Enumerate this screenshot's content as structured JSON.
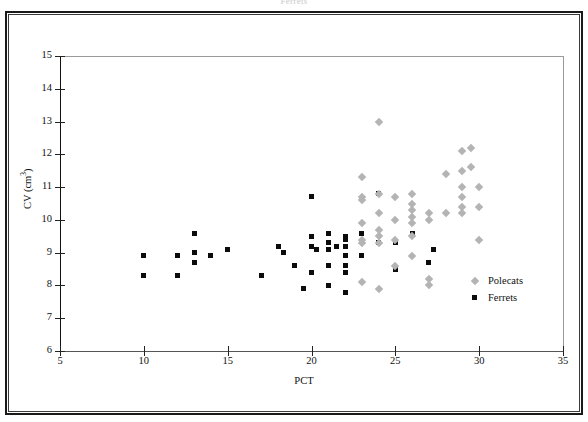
{
  "figure": {
    "top_caption": "Ferrets",
    "background": "#ffffff",
    "frame_color": "#1a1a1a"
  },
  "legend": {
    "position": "inside-right",
    "entries": [
      {
        "label": "Polecats",
        "marker": "diamond",
        "color": "#b4b4b4"
      },
      {
        "label": "Ferrets",
        "marker": "square",
        "color": "#0c0c0c"
      }
    ]
  },
  "chart_data": {
    "type": "scatter",
    "title": "",
    "xlabel": "PCT",
    "ylabel": "CV (cm³)",
    "xlim": [
      5,
      35
    ],
    "ylim": [
      6,
      15
    ],
    "xticks": [
      5,
      10,
      15,
      20,
      25,
      30,
      35
    ],
    "yticks": [
      6,
      7,
      8,
      9,
      10,
      11,
      12,
      13,
      14,
      15
    ],
    "grid": false,
    "series": [
      {
        "name": "Ferrets",
        "marker": "square",
        "color": "#0c0c0c",
        "points": [
          [
            10.0,
            8.9
          ],
          [
            10.0,
            8.3
          ],
          [
            12.0,
            8.9
          ],
          [
            12.0,
            8.3
          ],
          [
            13.0,
            9.6
          ],
          [
            13.0,
            9.0
          ],
          [
            13.0,
            8.7
          ],
          [
            14.0,
            8.9
          ],
          [
            15.0,
            9.1
          ],
          [
            17.0,
            8.3
          ],
          [
            18.0,
            9.2
          ],
          [
            18.3,
            9.0
          ],
          [
            19.0,
            8.6
          ],
          [
            19.5,
            7.9
          ],
          [
            20.0,
            10.7
          ],
          [
            20.0,
            9.5
          ],
          [
            20.0,
            9.2
          ],
          [
            20.0,
            8.4
          ],
          [
            20.3,
            9.1
          ],
          [
            21.0,
            9.6
          ],
          [
            21.0,
            9.3
          ],
          [
            21.0,
            9.1
          ],
          [
            21.0,
            8.6
          ],
          [
            21.0,
            8.0
          ],
          [
            21.5,
            9.2
          ],
          [
            22.0,
            9.5
          ],
          [
            22.0,
            9.4
          ],
          [
            22.0,
            9.2
          ],
          [
            22.0,
            8.9
          ],
          [
            22.0,
            8.6
          ],
          [
            22.0,
            8.4
          ],
          [
            22.0,
            7.8
          ],
          [
            23.0,
            9.6
          ],
          [
            23.0,
            8.9
          ],
          [
            24.0,
            10.8
          ],
          [
            24.0,
            9.3
          ],
          [
            25.0,
            9.3
          ],
          [
            25.0,
            8.5
          ],
          [
            26.0,
            9.6
          ],
          [
            27.0,
            8.7
          ],
          [
            27.3,
            9.1
          ]
        ]
      },
      {
        "name": "Polecats",
        "marker": "diamond",
        "color": "#b4b4b4",
        "points": [
          [
            23.0,
            11.3
          ],
          [
            23.0,
            10.7
          ],
          [
            23.0,
            10.6
          ],
          [
            23.0,
            9.9
          ],
          [
            23.0,
            9.4
          ],
          [
            23.0,
            9.3
          ],
          [
            23.0,
            8.1
          ],
          [
            24.0,
            13.0
          ],
          [
            24.0,
            10.8
          ],
          [
            24.0,
            10.2
          ],
          [
            24.0,
            9.7
          ],
          [
            24.0,
            9.5
          ],
          [
            24.0,
            9.3
          ],
          [
            24.0,
            7.9
          ],
          [
            25.0,
            10.7
          ],
          [
            25.0,
            10.0
          ],
          [
            25.0,
            9.4
          ],
          [
            25.0,
            8.6
          ],
          [
            26.0,
            10.8
          ],
          [
            26.0,
            10.5
          ],
          [
            26.0,
            10.3
          ],
          [
            26.0,
            10.1
          ],
          [
            26.0,
            9.9
          ],
          [
            26.0,
            9.5
          ],
          [
            26.0,
            8.9
          ],
          [
            27.0,
            10.2
          ],
          [
            27.0,
            10.0
          ],
          [
            27.0,
            8.2
          ],
          [
            27.0,
            8.0
          ],
          [
            28.0,
            11.4
          ],
          [
            28.0,
            10.2
          ],
          [
            29.0,
            12.1
          ],
          [
            29.0,
            11.5
          ],
          [
            29.0,
            11.0
          ],
          [
            29.0,
            10.7
          ],
          [
            29.0,
            10.4
          ],
          [
            29.0,
            10.2
          ],
          [
            29.5,
            12.2
          ],
          [
            29.5,
            11.6
          ],
          [
            30.0,
            11.0
          ],
          [
            30.0,
            10.4
          ],
          [
            30.0,
            9.4
          ]
        ]
      }
    ]
  }
}
